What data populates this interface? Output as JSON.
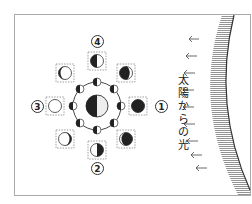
{
  "diagram": {
    "title_vertical": "太陽からの光",
    "title_chars": [
      "太",
      "陽",
      "か",
      "ら",
      "の",
      "光"
    ],
    "labels": [
      {
        "id": "1",
        "text": "1",
        "position": "right"
      },
      {
        "id": "2",
        "text": "2",
        "position": "bottom"
      },
      {
        "id": "3",
        "text": "3",
        "position": "left"
      },
      {
        "id": "4",
        "text": "4",
        "position": "top"
      }
    ],
    "center": {
      "name": "earth",
      "lit_side": "right"
    },
    "orbit_moons_count": 8,
    "moon_appearances": [
      {
        "position": "right",
        "phase": "new-moon",
        "label": "1"
      },
      {
        "position": "top-right",
        "phase": "waxing-crescent-small"
      },
      {
        "position": "top",
        "phase": "first-quarter-left-dark",
        "label": "4"
      },
      {
        "position": "top-left",
        "phase": "waxing-gibbous"
      },
      {
        "position": "left",
        "phase": "full-moon",
        "label": "3"
      },
      {
        "position": "bottom-left",
        "phase": "waning-gibbous"
      },
      {
        "position": "bottom",
        "phase": "last-quarter-right-dark",
        "label": "2"
      },
      {
        "position": "bottom-right",
        "phase": "waning-crescent-small"
      }
    ],
    "light_arrows_count": 9,
    "light_direction": "right-to-left",
    "colors": {
      "dark": "#222222",
      "light": "#ffffff",
      "frame": "#999999",
      "dash": "#888888"
    }
  }
}
